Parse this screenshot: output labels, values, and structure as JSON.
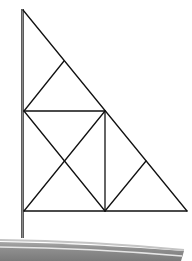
{
  "figure": {
    "colors": {
      "background": "#ffffff",
      "lines": "#111111",
      "mast": "#555555",
      "hull_dark": "#7d7d7d",
      "hull_mid": "#9a9a9a",
      "hull_light": "#c9c9c9",
      "hull_stripe": "#e8e8e8"
    },
    "mast": {
      "x": 22.5,
      "y_top": 9,
      "y_bottom": 238
    },
    "sail": {
      "apex": [
        23,
        10
      ],
      "bottom_left": [
        24,
        211
      ],
      "bottom_right": [
        187,
        211
      ],
      "mid_hypotenuse": [
        105,
        111
      ],
      "upper_quarter": [
        64,
        61
      ],
      "lower_quarter": [
        146,
        161
      ],
      "segments": [
        [
          [
            23,
            10
          ],
          [
            187,
            211
          ]
        ],
        [
          [
            24,
            211
          ],
          [
            187,
            211
          ]
        ],
        [
          [
            24,
            111
          ],
          [
            105,
            111
          ]
        ],
        [
          [
            105,
            111
          ],
          [
            105,
            211
          ]
        ],
        [
          [
            64,
            61
          ],
          [
            24,
            111
          ]
        ],
        [
          [
            24,
            111
          ],
          [
            105,
            211
          ]
        ],
        [
          [
            105,
            111
          ],
          [
            24,
            211
          ]
        ],
        [
          [
            146,
            161
          ],
          [
            105,
            211
          ]
        ]
      ]
    }
  }
}
